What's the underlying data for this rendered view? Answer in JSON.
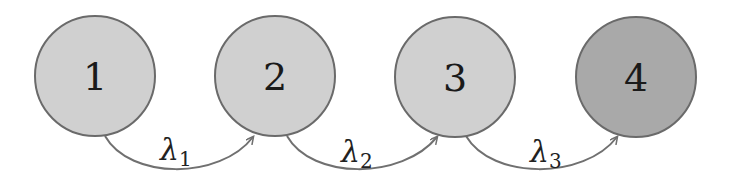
{
  "diagram": {
    "type": "chain",
    "colors": {
      "node_fill": "#d0d0d0",
      "final_node_fill": "#a9a9a9",
      "node_stroke": "#6a6a6a",
      "edge_stroke": "#707070",
      "background": "#ffffff"
    },
    "nodes": [
      {
        "id": "1",
        "label": "1",
        "cx": 95,
        "cy": 76,
        "r": 60,
        "final": false
      },
      {
        "id": "2",
        "label": "2",
        "cx": 275,
        "cy": 76,
        "r": 60,
        "final": false
      },
      {
        "id": "3",
        "label": "3",
        "cx": 455,
        "cy": 77,
        "r": 60,
        "final": false
      },
      {
        "id": "4",
        "label": "4",
        "cx": 636,
        "cy": 77,
        "r": 60,
        "final": true
      }
    ],
    "edges": [
      {
        "from": "1",
        "to": "2",
        "symbol": "λ",
        "subscript": "1"
      },
      {
        "from": "2",
        "to": "3",
        "symbol": "λ",
        "subscript": "2"
      },
      {
        "from": "3",
        "to": "4",
        "symbol": "λ",
        "subscript": "3"
      }
    ]
  }
}
